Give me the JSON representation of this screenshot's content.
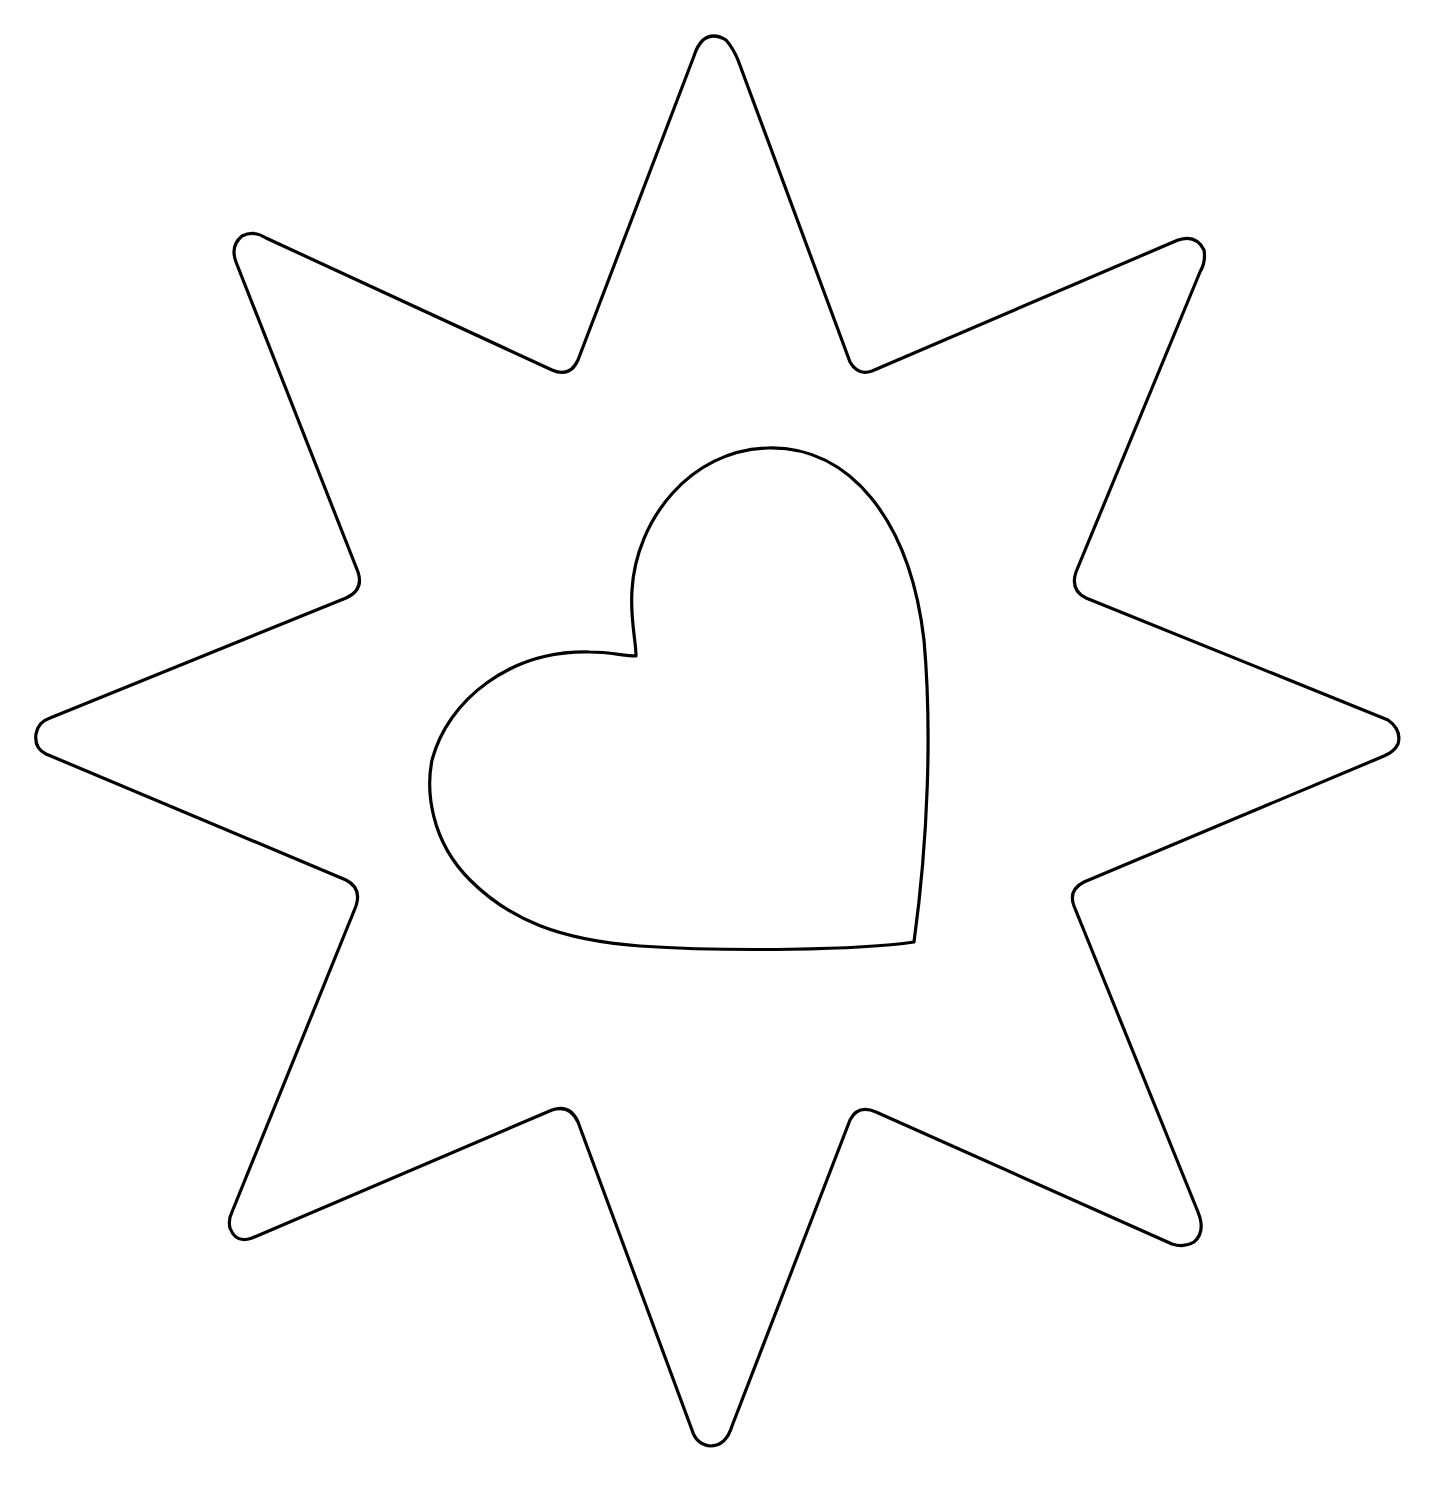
{
  "drawing": {
    "subject": "coloring-page",
    "background": "#ffffff",
    "stroke_color": "#000000",
    "stroke_width": 3.2,
    "shapes": [
      {
        "name": "eight-pointed-star",
        "points": 8
      },
      {
        "name": "heart",
        "orientation": "tilted-left"
      }
    ]
  }
}
